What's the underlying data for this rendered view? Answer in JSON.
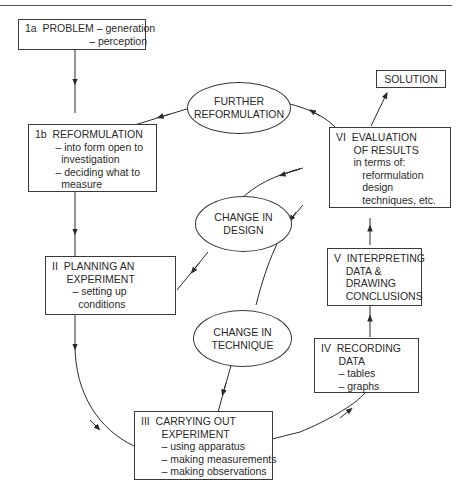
{
  "diagram": {
    "type": "flow-cycle",
    "nodes": {
      "problem": {
        "id": "1a",
        "lines": [
          "1a  PROBLEM – generation",
          "                      – perception"
        ]
      },
      "reformulation": {
        "id": "1b",
        "lines": [
          "1b  REFORMULATION",
          "       – into form open to",
          "         investigation",
          "       – deciding what to",
          "         measure"
        ]
      },
      "planning": {
        "id": "II",
        "lines": [
          "II  PLANNING AN",
          "     EXPERIMENT",
          "       – setting up",
          "         conditions"
        ]
      },
      "carrying_out": {
        "id": "III",
        "lines": [
          "III  CARRYING OUT",
          "       EXPERIMENT",
          "       – using apparatus",
          "       – making measurements",
          "       – making observations"
        ]
      },
      "recording": {
        "id": "IV",
        "lines": [
          "IV  RECORDING",
          "      DATA",
          "      – tables",
          "      – graphs"
        ]
      },
      "interpreting": {
        "id": "V",
        "lines": [
          "V  INTERPRETING",
          "    DATA &",
          "    DRAWING",
          "    CONCLUSIONS"
        ]
      },
      "evaluation": {
        "id": "VI",
        "lines": [
          "VI  EVALUATION",
          "      OF RESULTS",
          "      in terms of:",
          "         reformulation",
          "         design",
          "         techniques, etc."
        ]
      },
      "solution": {
        "lines": [
          "SOLUTION"
        ]
      },
      "further_reformulation": {
        "lines": [
          "FURTHER",
          "REFORMULATION"
        ]
      },
      "change_design": {
        "lines": [
          "CHANGE IN",
          "DESIGN"
        ]
      },
      "change_technique": {
        "lines": [
          "CHANGE IN",
          "TECHNIQUE"
        ]
      }
    },
    "edges": [
      {
        "from": "1a PROBLEM",
        "to": "1b REFORMULATION"
      },
      {
        "from": "1b REFORMULATION",
        "to": "II PLANNING AN EXPERIMENT"
      },
      {
        "from": "II PLANNING AN EXPERIMENT",
        "to": "III CARRYING OUT EXPERIMENT"
      },
      {
        "from": "III CARRYING OUT EXPERIMENT",
        "to": "IV RECORDING DATA"
      },
      {
        "from": "IV RECORDING DATA",
        "to": "V INTERPRETING DATA & DRAWING CONCLUSIONS"
      },
      {
        "from": "V INTERPRETING DATA & DRAWING CONCLUSIONS",
        "to": "VI EVALUATION OF RESULTS"
      },
      {
        "from": "VI EVALUATION OF RESULTS",
        "to": "SOLUTION"
      },
      {
        "from": "VI EVALUATION OF RESULTS",
        "to": "FURTHER REFORMULATION"
      },
      {
        "from": "FURTHER REFORMULATION",
        "to": "1b REFORMULATION"
      },
      {
        "from": "VI EVALUATION OF RESULTS",
        "to": "CHANGE IN DESIGN"
      },
      {
        "from": "CHANGE IN DESIGN",
        "to": "II PLANNING AN EXPERIMENT"
      },
      {
        "from": "VI EVALUATION OF RESULTS",
        "to": "CHANGE IN TECHNIQUE"
      },
      {
        "from": "CHANGE IN TECHNIQUE",
        "to": "III CARRYING OUT EXPERIMENT"
      }
    ]
  }
}
